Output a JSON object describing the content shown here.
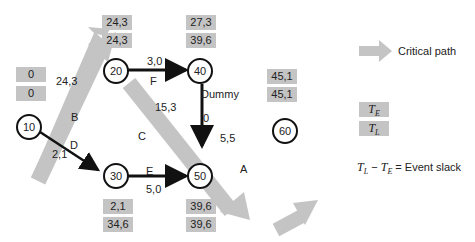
{
  "nodes": [
    {
      "id": "10",
      "label": "10",
      "te": "0",
      "tl": "0"
    },
    {
      "id": "20",
      "label": "20",
      "te": "24,3",
      "tl": "24,3"
    },
    {
      "id": "30",
      "label": "30",
      "te": "2,1",
      "tl": "34,6"
    },
    {
      "id": "40",
      "label": "40",
      "te": "27,3",
      "tl": "39,6"
    },
    {
      "id": "50",
      "label": "50",
      "te": "39,6",
      "tl": "39,6"
    },
    {
      "id": "60",
      "label": "60",
      "te": "45,1",
      "tl": "45,1"
    }
  ],
  "activities": [
    {
      "name": "B",
      "from": "10",
      "to": "20",
      "duration": "24,3",
      "critical": true
    },
    {
      "name": "D",
      "from": "10",
      "to": "30",
      "duration": "2,1",
      "critical": false
    },
    {
      "name": "F",
      "from": "20",
      "to": "40",
      "duration": "3,0",
      "critical": false
    },
    {
      "name": "C",
      "from": "20",
      "to": "50",
      "duration": "15,3",
      "critical": true
    },
    {
      "name": "Dummy",
      "from": "40",
      "to": "50",
      "duration": "0",
      "critical": false
    },
    {
      "name": "E",
      "from": "30",
      "to": "50",
      "duration": "5,0",
      "critical": false
    },
    {
      "name": "A",
      "from": "50",
      "to": "60",
      "duration": "5,5",
      "critical": true
    }
  ],
  "legend": {
    "critical_path": "Critical path",
    "te_label": "T",
    "te_sub": "E",
    "tl_label": "T",
    "tl_sub": "L",
    "slack_formula_text": "= Event slack"
  },
  "colors": {
    "critical": "#c4c4c4",
    "normal": "#111111",
    "box": "#c4c4c4"
  }
}
